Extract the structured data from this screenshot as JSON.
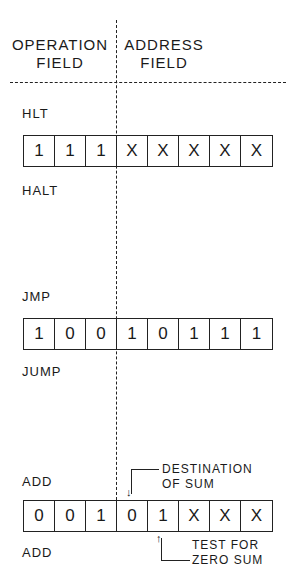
{
  "header": {
    "operation_field": [
      "OPERATION",
      "FIELD"
    ],
    "address_field": [
      "ADDRESS",
      "FIELD"
    ]
  },
  "instructions": [
    {
      "mnemonic": "HLT",
      "name": "HALT",
      "bits": [
        "1",
        "1",
        "1",
        "X",
        "X",
        "X",
        "X",
        "X"
      ]
    },
    {
      "mnemonic": "JMP",
      "name": "JUMP",
      "bits": [
        "1",
        "0",
        "0",
        "1",
        "0",
        "1",
        "1",
        "1"
      ]
    },
    {
      "mnemonic": "ADD",
      "name": "ADD",
      "bits": [
        "0",
        "0",
        "1",
        "0",
        "1",
        "X",
        "X",
        "X"
      ],
      "annotations": {
        "destination": [
          "DESTINATION",
          "OF SUM"
        ],
        "test": [
          "TEST FOR",
          "ZERO SUM"
        ]
      }
    }
  ]
}
